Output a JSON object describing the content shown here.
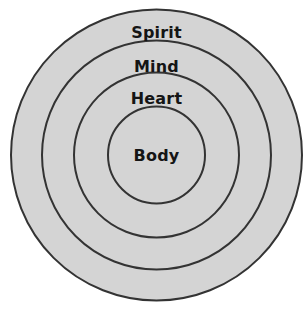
{
  "diagram": {
    "type": "concentric-circles",
    "background_color": "#ffffff",
    "ring_fill_color": "#d4d4d4",
    "ring_stroke_color": "#333333",
    "label_color": "#151515",
    "center": {
      "x": 156.5,
      "y": 155
    },
    "rings": [
      {
        "label": "Spirit",
        "level": 1,
        "radius": 145.5,
        "label_x": 156.5,
        "label_y": 33
      },
      {
        "label": "Mind",
        "level": 2,
        "radius": 114.5,
        "label_x": 156.5,
        "label_y": 67
      },
      {
        "label": "Heart",
        "level": 3,
        "radius": 82.5,
        "label_x": 156.5,
        "label_y": 99
      },
      {
        "label": "Body",
        "level": 4,
        "radius": 48.5,
        "label_x": 156.5,
        "label_y": 156
      }
    ]
  },
  "chart_data": {
    "type": "diagram",
    "categories": [
      "Spirit",
      "Mind",
      "Heart",
      "Body"
    ],
    "values": [
      145.5,
      114.5,
      82.5,
      48.5
    ],
    "value_label": "circle radius (px)",
    "xlabel": "",
    "ylabel": "",
    "legend": "none",
    "grid": false
  }
}
